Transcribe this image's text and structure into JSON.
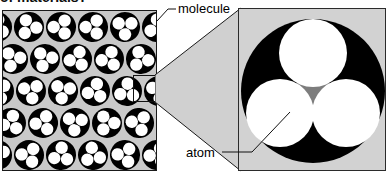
{
  "figure": {
    "heading_fragment": "of materials?",
    "width": 388,
    "height": 173,
    "caption_alt": "Lattice of molecules magnified to show three atoms"
  },
  "colors": {
    "lattice_background": "#c9c9c9",
    "molecule_shell": "#000000",
    "atom_fill": "#ffffff",
    "magnified_background": "#d2d2d2",
    "connector_fill": "#d0d0d0",
    "outline": "#1a1a1a",
    "interstitial_gray": "#7d7d7d",
    "label_text": "#000000"
  },
  "labels": {
    "molecule": "molecule",
    "atom": "atom"
  },
  "left_panel": {
    "name": "crystal lattice",
    "background_color": "#c9c9c9",
    "rows": 5,
    "columns": 5,
    "molecule_radius": 15,
    "atom_radius": 6.2,
    "atoms_per_molecule": 3,
    "row_offset_px": 16,
    "molecules": [
      {
        "row": 0,
        "cx": -6,
        "cy": 16,
        "rot": 10
      },
      {
        "row": 0,
        "cx": 26,
        "cy": 16,
        "rot": 95
      },
      {
        "row": 0,
        "cx": 58,
        "cy": 16,
        "rot": 30
      },
      {
        "row": 0,
        "cx": 90,
        "cy": 16,
        "rot": 150
      },
      {
        "row": 0,
        "cx": 122,
        "cy": 16,
        "rot": 60
      },
      {
        "row": 0,
        "cx": 154,
        "cy": 16,
        "rot": 120
      },
      {
        "row": 1,
        "cx": 10,
        "cy": 48,
        "rot": 200
      },
      {
        "row": 1,
        "cx": 42,
        "cy": 48,
        "rot": 80
      },
      {
        "row": 1,
        "cx": 74,
        "cy": 48,
        "rot": 20
      },
      {
        "row": 1,
        "cx": 106,
        "cy": 48,
        "rot": 140
      },
      {
        "row": 1,
        "cx": 138,
        "cy": 48,
        "rot": 100
      },
      {
        "row": 2,
        "cx": -4,
        "cy": 80,
        "rot": 45
      },
      {
        "row": 2,
        "cx": 28,
        "cy": 80,
        "rot": 170
      },
      {
        "row": 2,
        "cx": 60,
        "cy": 80,
        "rot": 70
      },
      {
        "row": 2,
        "cx": 92,
        "cy": 80,
        "rot": 15
      },
      {
        "row": 2,
        "cx": 124,
        "cy": 80,
        "rot": 125
      },
      {
        "row": 2,
        "cx": 156,
        "cy": 80,
        "rot": 55
      },
      {
        "row": 3,
        "cx": 8,
        "cy": 112,
        "rot": 135
      },
      {
        "row": 3,
        "cx": 40,
        "cy": 112,
        "rot": 25
      },
      {
        "row": 3,
        "cx": 72,
        "cy": 112,
        "rot": 185
      },
      {
        "row": 3,
        "cx": 104,
        "cy": 112,
        "rot": 90
      },
      {
        "row": 3,
        "cx": 136,
        "cy": 112,
        "rot": 40
      },
      {
        "row": 4,
        "cx": -6,
        "cy": 144,
        "rot": 65
      },
      {
        "row": 4,
        "cx": 26,
        "cy": 144,
        "rot": 155
      },
      {
        "row": 4,
        "cx": 58,
        "cy": 144,
        "rot": 5
      },
      {
        "row": 4,
        "cx": 90,
        "cy": 144,
        "rot": 110
      },
      {
        "row": 4,
        "cx": 122,
        "cy": 144,
        "rot": 35
      },
      {
        "row": 4,
        "cx": 154,
        "cy": 144,
        "rot": 145
      }
    ]
  },
  "callout": {
    "name": "selected molecule",
    "x": 133,
    "y": 75,
    "width": 24,
    "height": 27
  },
  "right_panel": {
    "name": "magnified molecule",
    "background_color": "#d2d2d2",
    "shell_center": {
      "cx": 74,
      "cy": 82
    },
    "shell_radius": 72,
    "atoms": [
      {
        "id": "top",
        "cx": 74,
        "cy": 44,
        "r": 34
      },
      {
        "id": "bottom-left",
        "cx": 41,
        "cy": 104,
        "r": 34
      },
      {
        "id": "bottom-right",
        "cx": 107,
        "cy": 104,
        "r": 34
      }
    ]
  }
}
